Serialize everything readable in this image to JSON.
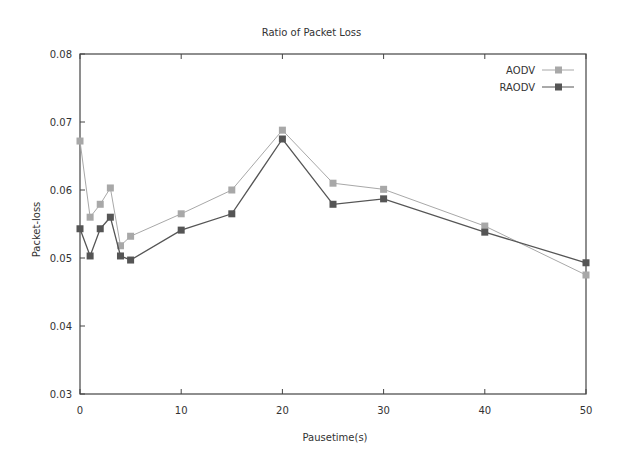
{
  "chart_data": {
    "type": "line",
    "title": "Ratio of Packet Loss",
    "xlabel": "Pausetime(s)",
    "ylabel": "Packet-loss",
    "xlim": [
      0,
      50
    ],
    "ylim": [
      0.03,
      0.08
    ],
    "xticks": [
      0,
      10,
      20,
      30,
      40,
      50
    ],
    "yticks": [
      0.03,
      0.04,
      0.05,
      0.06,
      0.07,
      0.08
    ],
    "ytick_labels": [
      "0.03",
      "0.04",
      "0.05",
      "0.06",
      "0.07",
      "0.08"
    ],
    "grid": false,
    "legend_position": "upper right",
    "x": [
      0,
      1,
      2,
      3,
      4,
      5,
      10,
      15,
      20,
      25,
      30,
      40,
      50
    ],
    "series": [
      {
        "name": "AODV",
        "color": "#a8a8a8",
        "values": [
          0.0672,
          0.056,
          0.0579,
          0.0603,
          0.0518,
          0.0532,
          0.0565,
          0.06,
          0.0688,
          0.061,
          0.0601,
          0.0547,
          0.0475
        ]
      },
      {
        "name": "RAODV",
        "color": "#555555",
        "values": [
          0.0543,
          0.0503,
          0.0543,
          0.056,
          0.0503,
          0.0497,
          0.0541,
          0.0565,
          0.0675,
          0.0579,
          0.0587,
          0.0538,
          0.0493
        ]
      }
    ]
  }
}
